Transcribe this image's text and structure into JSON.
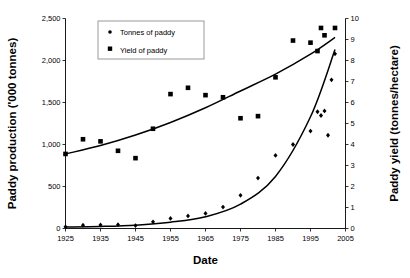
{
  "chart_data": {
    "type": "scatter",
    "title": "",
    "xlabel": "Date",
    "ylabel": "Paddy production ('000 tonnes)",
    "y2label": "Paddy yield (tonnes/hectare)",
    "xlim": [
      1925,
      2005
    ],
    "ylim": [
      0,
      2500
    ],
    "y2lim": [
      0,
      10
    ],
    "xticks": [
      "1925",
      "1935",
      "1945",
      "1955",
      "1965",
      "1975",
      "1985",
      "1995",
      "2005"
    ],
    "xtick_values": [
      1925,
      1935,
      1945,
      1955,
      1965,
      1975,
      1985,
      1995,
      2005
    ],
    "yticks": [
      "0",
      "500",
      "1,000",
      "1,500",
      "2,000",
      "2,500"
    ],
    "ytick_values": [
      0,
      500,
      1000,
      1500,
      2000,
      2500
    ],
    "y2ticks": [
      "0",
      "1",
      "2",
      "3",
      "4",
      "5",
      "6",
      "7",
      "8",
      "9",
      "10"
    ],
    "y2tick_values": [
      0,
      1,
      2,
      3,
      4,
      5,
      6,
      7,
      8,
      9,
      10
    ],
    "grid": false,
    "legend_position": "top-left-inside",
    "series": [
      {
        "name": "Tonnes of paddy",
        "marker": "diamond",
        "axis": "left",
        "unit": "'000 tonnes",
        "points": [
          {
            "x": 1925,
            "y": 20
          },
          {
            "x": 1930,
            "y": 40
          },
          {
            "x": 1935,
            "y": 42
          },
          {
            "x": 1940,
            "y": 45
          },
          {
            "x": 1945,
            "y": 35
          },
          {
            "x": 1950,
            "y": 80
          },
          {
            "x": 1955,
            "y": 120
          },
          {
            "x": 1960,
            "y": 150
          },
          {
            "x": 1965,
            "y": 180
          },
          {
            "x": 1970,
            "y": 255
          },
          {
            "x": 1975,
            "y": 395
          },
          {
            "x": 1980,
            "y": 600
          },
          {
            "x": 1985,
            "y": 870
          },
          {
            "x": 1990,
            "y": 1000
          },
          {
            "x": 1995,
            "y": 1160
          },
          {
            "x": 1997,
            "y": 1390
          },
          {
            "x": 1998,
            "y": 1345
          },
          {
            "x": 1999,
            "y": 1400
          },
          {
            "x": 2000,
            "y": 1110
          },
          {
            "x": 2001,
            "y": 1770
          },
          {
            "x": 2002,
            "y": 2080
          }
        ]
      },
      {
        "name": "Yield of paddy",
        "marker": "square",
        "axis": "right",
        "unit": "tonnes/hectare",
        "points": [
          {
            "x": 1925,
            "y": 3.55
          },
          {
            "x": 1930,
            "y": 4.25
          },
          {
            "x": 1935,
            "y": 4.15
          },
          {
            "x": 1940,
            "y": 3.7
          },
          {
            "x": 1945,
            "y": 3.35
          },
          {
            "x": 1950,
            "y": 4.75
          },
          {
            "x": 1955,
            "y": 6.4
          },
          {
            "x": 1960,
            "y": 6.7
          },
          {
            "x": 1965,
            "y": 6.35
          },
          {
            "x": 1970,
            "y": 6.25
          },
          {
            "x": 1975,
            "y": 5.25
          },
          {
            "x": 1980,
            "y": 5.35
          },
          {
            "x": 1985,
            "y": 7.2
          },
          {
            "x": 1990,
            "y": 8.95
          },
          {
            "x": 1995,
            "y": 8.85
          },
          {
            "x": 1997,
            "y": 8.45
          },
          {
            "x": 1998,
            "y": 9.55
          },
          {
            "x": 1999,
            "y": 9.2
          },
          {
            "x": 2002,
            "y": 9.55
          }
        ]
      }
    ],
    "trendlines": [
      {
        "name": "Yield of paddy trend",
        "axis": "right",
        "type": "exponential",
        "points": [
          {
            "x": 1925,
            "y": 3.55
          },
          {
            "x": 1935,
            "y": 3.95
          },
          {
            "x": 1945,
            "y": 4.45
          },
          {
            "x": 1955,
            "y": 5.05
          },
          {
            "x": 1965,
            "y": 5.75
          },
          {
            "x": 1975,
            "y": 6.55
          },
          {
            "x": 1985,
            "y": 7.35
          },
          {
            "x": 1995,
            "y": 8.3
          },
          {
            "x": 2002,
            "y": 9.1
          }
        ]
      },
      {
        "name": "Tonnes of paddy trend",
        "axis": "left",
        "type": "exponential",
        "points": [
          {
            "x": 1925,
            "y": 18
          },
          {
            "x": 1935,
            "y": 25
          },
          {
            "x": 1945,
            "y": 40
          },
          {
            "x": 1955,
            "y": 75
          },
          {
            "x": 1965,
            "y": 140
          },
          {
            "x": 1975,
            "y": 290
          },
          {
            "x": 1985,
            "y": 620
          },
          {
            "x": 1995,
            "y": 1330
          },
          {
            "x": 2002,
            "y": 2130
          }
        ]
      }
    ]
  },
  "legend": {
    "items": [
      {
        "label": "Tonnes of paddy",
        "marker": "diamond"
      },
      {
        "label": "Yield of paddy",
        "marker": "square"
      }
    ]
  },
  "colors": {
    "ink": "#000000",
    "axis": "#000000",
    "legend_border": "#808080",
    "background": "#ffffff"
  }
}
